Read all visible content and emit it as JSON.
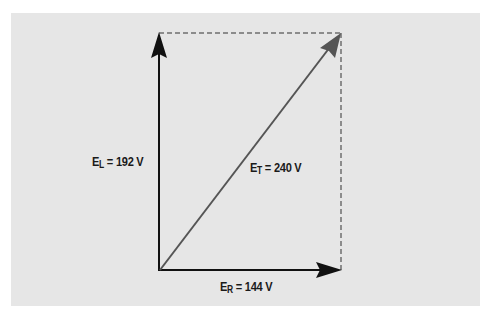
{
  "diagram": {
    "title": "",
    "type": "phasor diagram",
    "colors": {
      "background": "#ffffff",
      "panel": "#e6e6e6",
      "arrow_primary": "#111111",
      "arrow_resultant": "#555555",
      "dashed_line": "#333333"
    },
    "vectors": [
      {
        "id": "EL",
        "symbol": "E",
        "subscript": "L",
        "value": "192 V",
        "direction": "up"
      },
      {
        "id": "ER",
        "symbol": "E",
        "subscript": "R",
        "value": "144 V",
        "direction": "right"
      },
      {
        "id": "ET",
        "symbol": "E",
        "subscript": "T",
        "value": "240 V",
        "direction": "diagonal"
      }
    ],
    "labels": {
      "el": {
        "symbol": "E",
        "subscript": "L",
        "rest": " = 192 V"
      },
      "et": {
        "symbol": "E",
        "subscript": "T",
        "rest": " = 240 V"
      },
      "er": {
        "symbol": "E",
        "subscript": "R",
        "rest": " = 144 V"
      }
    }
  }
}
